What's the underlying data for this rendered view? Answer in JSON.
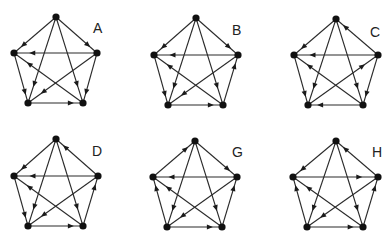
{
  "figure": {
    "node_color": "#111111",
    "edge_color": "#2a2a2a",
    "graphs": [
      {
        "label": "A",
        "label_pos": [
          93,
          33
        ],
        "nodes": {
          "T": [
            56,
            17
          ],
          "L": [
            14,
            53
          ],
          "R": [
            97,
            53
          ],
          "BL": [
            28,
            103
          ],
          "BR": [
            83,
            103
          ]
        },
        "edges": [
          [
            "T",
            "L"
          ],
          [
            "T",
            "R"
          ],
          [
            "R",
            "L"
          ],
          [
            "L",
            "BL"
          ],
          [
            "T",
            "BL"
          ],
          [
            "T",
            "BR"
          ],
          [
            "R",
            "BR"
          ],
          [
            "R",
            "BL"
          ],
          [
            "BR",
            "L"
          ],
          [
            "BL",
            "BR"
          ]
        ]
      },
      {
        "label": "B",
        "label_pos": [
          232,
          35
        ],
        "nodes": {
          "T": [
            196,
            18
          ],
          "L": [
            154,
            55
          ],
          "R": [
            238,
            55
          ],
          "BL": [
            168,
            105
          ],
          "BR": [
            223,
            105
          ]
        },
        "edges": [
          [
            "T",
            "L"
          ],
          [
            "T",
            "R"
          ],
          [
            "R",
            "L"
          ],
          [
            "L",
            "BL"
          ],
          [
            "T",
            "BL"
          ],
          [
            "T",
            "BR"
          ],
          [
            "BR",
            "R"
          ],
          [
            "R",
            "BL"
          ],
          [
            "BR",
            "L"
          ],
          [
            "BL",
            "BR"
          ]
        ]
      },
      {
        "label": "C",
        "label_pos": [
          370,
          37
        ],
        "nodes": {
          "T": [
            336,
            19
          ],
          "L": [
            294,
            55
          ],
          "R": [
            378,
            55
          ],
          "BL": [
            308,
            105
          ],
          "BR": [
            363,
            105
          ]
        },
        "edges": [
          [
            "T",
            "L"
          ],
          [
            "R",
            "T"
          ],
          [
            "R",
            "L"
          ],
          [
            "L",
            "BL"
          ],
          [
            "T",
            "BL"
          ],
          [
            "T",
            "BR"
          ],
          [
            "R",
            "BR"
          ],
          [
            "BL",
            "R"
          ],
          [
            "BR",
            "L"
          ],
          [
            "BR",
            "BL"
          ]
        ]
      },
      {
        "label": "D",
        "label_pos": [
          92,
          156
        ],
        "nodes": {
          "T": [
            56,
            139
          ],
          "L": [
            14,
            176
          ],
          "R": [
            98,
            176
          ],
          "BL": [
            28,
            226
          ],
          "BR": [
            83,
            226
          ]
        },
        "edges": [
          [
            "T",
            "L"
          ],
          [
            "R",
            "T"
          ],
          [
            "R",
            "L"
          ],
          [
            "L",
            "BL"
          ],
          [
            "T",
            "BL"
          ],
          [
            "T",
            "BR"
          ],
          [
            "BR",
            "R"
          ],
          [
            "R",
            "BL"
          ],
          [
            "BR",
            "L"
          ],
          [
            "BL",
            "BR"
          ]
        ]
      },
      {
        "label": "G",
        "label_pos": [
          232,
          157
        ],
        "nodes": {
          "T": [
            195,
            141
          ],
          "L": [
            153,
            177
          ],
          "R": [
            237,
            177
          ],
          "BL": [
            167,
            227
          ],
          "BR": [
            222,
            227
          ]
        },
        "edges": [
          [
            "L",
            "T"
          ],
          [
            "T",
            "R"
          ],
          [
            "R",
            "L"
          ],
          [
            "BL",
            "L"
          ],
          [
            "T",
            "BL"
          ],
          [
            "T",
            "BR"
          ],
          [
            "BR",
            "R"
          ],
          [
            "R",
            "BL"
          ],
          [
            "BR",
            "L"
          ],
          [
            "BL",
            "BR"
          ]
        ]
      },
      {
        "label": "H",
        "label_pos": [
          372,
          157
        ],
        "nodes": {
          "T": [
            336,
            141
          ],
          "L": [
            293,
            177
          ],
          "R": [
            378,
            177
          ],
          "BL": [
            307,
            227
          ],
          "BR": [
            363,
            227
          ]
        },
        "edges": [
          [
            "T",
            "L"
          ],
          [
            "R",
            "T"
          ],
          [
            "L",
            "R"
          ],
          [
            "BL",
            "L"
          ],
          [
            "T",
            "BL"
          ],
          [
            "T",
            "BR"
          ],
          [
            "BR",
            "R"
          ],
          [
            "R",
            "BL"
          ],
          [
            "BR",
            "L"
          ],
          [
            "BL",
            "BR"
          ]
        ]
      }
    ]
  }
}
